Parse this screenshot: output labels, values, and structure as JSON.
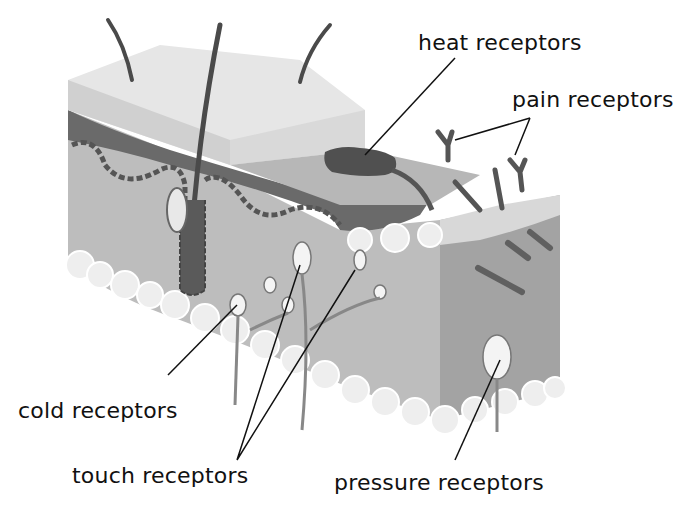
{
  "diagram": {
    "colors": {
      "background": "#ffffff",
      "epidermis_top": "#e6e6e6",
      "epidermis_side": "#d4d4d4",
      "dermis_band": "#6a6a6a",
      "dermis": "#bdbdbd",
      "dermis_shadow": "#9e9e9e",
      "fat": "#ececec",
      "hair": "#4a4a4a",
      "receptor": "#f4f4f4",
      "leader_line": "#111111",
      "text": "#111111"
    },
    "labels": {
      "heat": "heat receptors",
      "pain": "pain receptors",
      "cold": "cold receptors",
      "touch": "touch receptors",
      "pressure": "pressure receptors"
    }
  }
}
